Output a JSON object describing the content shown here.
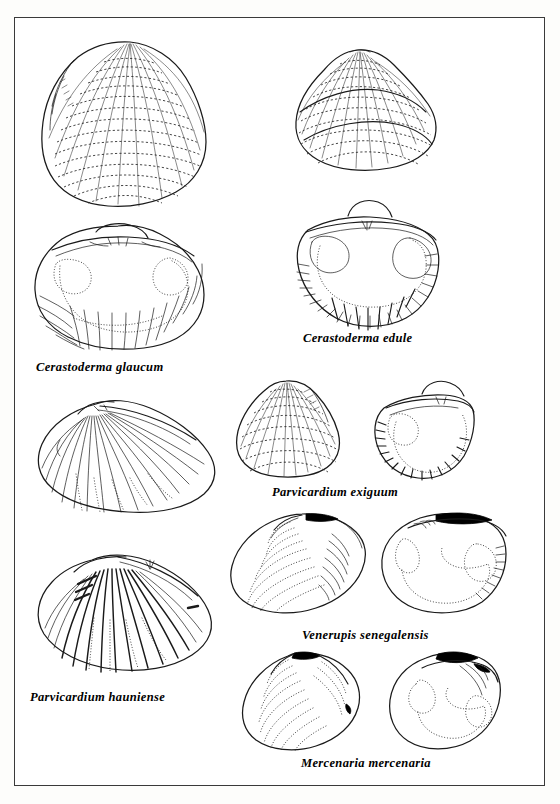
{
  "plate": {
    "background_color": "#ffffff",
    "border_color": "#3a3a3a",
    "ink_color": "#1a1a1a",
    "ligament_color": "#000000",
    "figure_count": 6,
    "illustration_style": "pen-and-ink line drawing"
  },
  "species": [
    {
      "id": "cerastoderma-glaucum",
      "label": "Cerastoderma glaucum",
      "views": [
        "exterior",
        "interior"
      ],
      "column": "left"
    },
    {
      "id": "cerastoderma-edule",
      "label": "Cerastoderma edule",
      "views": [
        "exterior",
        "interior"
      ],
      "column": "right"
    },
    {
      "id": "parvicardium-exiguum",
      "label": "Parvicardium exiguum",
      "views": [
        "exterior",
        "interior"
      ],
      "column": "right"
    },
    {
      "id": "parvicardium-hauniense",
      "label": "Parvicardium hauniense",
      "views": [
        "exterior",
        "exterior-ribbed"
      ],
      "column": "left"
    },
    {
      "id": "venerupis-senegalensis",
      "label": "Venerupis senegalensis",
      "views": [
        "exterior",
        "interior"
      ],
      "column": "right"
    },
    {
      "id": "mercenaria-mercenaria",
      "label": "Mercenaria mercenaria",
      "views": [
        "exterior",
        "interior"
      ],
      "column": "right"
    }
  ]
}
